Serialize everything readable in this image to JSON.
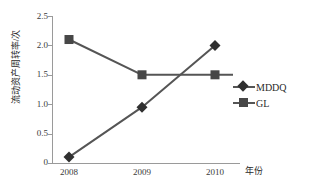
{
  "chart_data": {
    "type": "line",
    "title": "",
    "xlabel": "年份",
    "ylabel": "流动资产周转率/次",
    "categories": [
      "2008",
      "2009",
      "2010"
    ],
    "series": [
      {
        "name": "MDDQ",
        "marker": "diamond",
        "color": "#303030",
        "values": [
          0.1,
          0.95,
          2.0
        ]
      },
      {
        "name": "GL",
        "marker": "square",
        "color": "#474747",
        "values": [
          2.1,
          1.5,
          1.5
        ]
      }
    ],
    "ylim": [
      0,
      2.5
    ],
    "yticks": [
      "0",
      "0.5",
      "1.0",
      "1.5",
      "2.0",
      "2.5"
    ],
    "ytick_values": [
      0,
      0.5,
      1.0,
      1.5,
      2.0,
      2.5
    ],
    "grid": false,
    "legend_position": "right",
    "axis_color": "#9a9a9a",
    "line_color": "#555555"
  }
}
